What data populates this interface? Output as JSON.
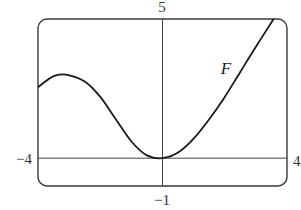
{
  "chart_data": {
    "type": "line",
    "title": "",
    "xlabel": "",
    "ylabel": "",
    "xlim": [
      -4,
      4
    ],
    "ylim": [
      -1,
      5
    ],
    "grid": false,
    "legend": "none",
    "tick_labels": {
      "x_left": "−4",
      "x_right": "4",
      "y_top": "5",
      "y_bottom": "−1"
    },
    "annotations": [
      {
        "text": "F",
        "x": 2.1,
        "y": 3.3,
        "style": "italic"
      }
    ],
    "series": [
      {
        "name": "F",
        "x": [
          -4.0,
          -3.5,
          -3.1,
          -2.5,
          -2.0,
          -1.5,
          -1.0,
          -0.5,
          0.0,
          0.5,
          1.0,
          1.5,
          2.0,
          2.5,
          3.0,
          3.57
        ],
        "y": [
          2.55,
          2.95,
          3.0,
          2.75,
          2.2,
          1.4,
          0.6,
          0.1,
          0.0,
          0.2,
          0.7,
          1.4,
          2.2,
          3.1,
          4.0,
          5.0
        ]
      }
    ],
    "reference_lines": [
      {
        "orientation": "horizontal",
        "y": 0
      },
      {
        "orientation": "vertical",
        "x": 0
      }
    ]
  },
  "partial_label": ")"
}
